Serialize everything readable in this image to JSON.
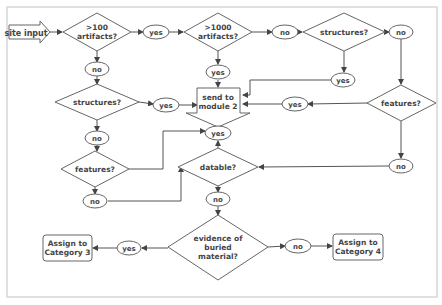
{
  "diagram": {
    "type": "flowchart",
    "start": {
      "label": "site input"
    },
    "decisions": {
      "d_artifacts100": {
        "line1": ">100",
        "line2": "artifacts?"
      },
      "d_artifacts1000": {
        "line1": ">1000",
        "line2": "artifacts?"
      },
      "d_structures_top": {
        "label": "structures?"
      },
      "d_structures_left": {
        "label": "structures?"
      },
      "d_features_right": {
        "label": "features?"
      },
      "d_features_left": {
        "label": "features?"
      },
      "d_datable": {
        "label": "datable?"
      },
      "d_evidence": {
        "line1": "evidence of",
        "line2": "buried",
        "line3": "material?"
      }
    },
    "terminals": {
      "module2": {
        "line1": "send to",
        "line2": "module 2"
      },
      "category3": {
        "line1": "Assign to",
        "line2": "Category 3"
      },
      "category4": {
        "line1": "Assign to",
        "line2": "Category 4"
      }
    },
    "edge_labels": {
      "a100_yes": "yes",
      "a100_no": "no",
      "a1000_no": "no",
      "a1000_yes": "yes",
      "struct_top_no": "no",
      "struct_top_yes": "yes",
      "struct_left_yes": "yes",
      "struct_left_no": "no",
      "feat_right_yes": "yes",
      "feat_right_no": "no",
      "feat_left_no": "no",
      "datable_yes": "yes",
      "datable_no": "no",
      "evidence_yes": "yes",
      "evidence_no": "no"
    },
    "edges": [
      [
        "site input",
        ">100 artifacts?"
      ],
      [
        ">100 artifacts?",
        "yes",
        ">1000 artifacts?"
      ],
      [
        ">100 artifacts?",
        "no",
        "structures? (left)"
      ],
      [
        ">1000 artifacts?",
        "yes",
        "send to module 2"
      ],
      [
        ">1000 artifacts?",
        "no",
        "structures? (top)"
      ],
      [
        "structures? (top)",
        "yes",
        "send to module 2"
      ],
      [
        "structures? (top)",
        "no",
        "features? (right)"
      ],
      [
        "features? (right)",
        "yes",
        "send to module 2"
      ],
      [
        "features? (right)",
        "no",
        "datable?"
      ],
      [
        "structures? (left)",
        "yes",
        "send to module 2"
      ],
      [
        "structures? (left)",
        "no",
        "features? (left)"
      ],
      [
        "features? (left)",
        "yes",
        "send to module 2"
      ],
      [
        "features? (left)",
        "no",
        "datable?"
      ],
      [
        "datable?",
        "yes",
        "send to module 2"
      ],
      [
        "datable?",
        "no",
        "evidence of buried material?"
      ],
      [
        "evidence of buried material?",
        "yes",
        "Assign to Category 3"
      ],
      [
        "evidence of buried material?",
        "no",
        "Assign to Category 4"
      ]
    ]
  }
}
